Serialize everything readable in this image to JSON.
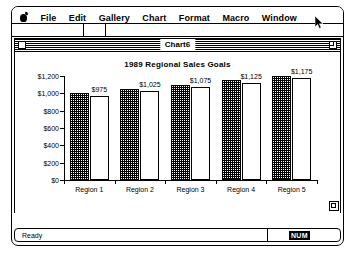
{
  "menubar": {
    "apple_icon": "apple-logo-icon",
    "items": [
      {
        "label": "File"
      },
      {
        "label": "Edit"
      },
      {
        "label": "Gallery"
      },
      {
        "label": "Chart"
      },
      {
        "label": "Format"
      },
      {
        "label": "Macro"
      },
      {
        "label": "Window"
      }
    ]
  },
  "formula_bar": {
    "name_box_value": "",
    "fx_value": "",
    "formula_value": ""
  },
  "document": {
    "title": "Chart6",
    "close_box_icon": "close-box-icon",
    "zoom_box_icon": "zoom-box-icon",
    "grow_box_icon": "resize-grow-box-icon"
  },
  "status_bar": {
    "message": "Ready",
    "num_lock_label": "NUM"
  },
  "cursor": {
    "icon": "arrow-pointer-icon"
  },
  "chart_data": {
    "type": "bar",
    "title": "1989 Regional Sales Goals",
    "xlabel": "",
    "ylabel": "",
    "categories": [
      "Region 1",
      "Region 2",
      "Region 3",
      "Region 4",
      "Region 5"
    ],
    "series": [
      {
        "name": "Series 1",
        "style": "hatched",
        "values": [
          1000,
          1050,
          1100,
          1150,
          1200
        ]
      },
      {
        "name": "Series 2",
        "style": "plain",
        "values": [
          975,
          1025,
          1075,
          1125,
          1175
        ]
      }
    ],
    "data_labels": [
      "$975",
      "$1,025",
      "$1,075",
      "$1,125",
      "$1,175"
    ],
    "ylim": [
      0,
      1200
    ],
    "yticks": [
      0,
      200,
      400,
      600,
      800,
      1000,
      1200
    ],
    "ytick_labels": [
      "$0",
      "$200",
      "$400",
      "$600",
      "$800",
      "$1,000",
      "$1,200"
    ],
    "grid": false,
    "legend": "none"
  }
}
